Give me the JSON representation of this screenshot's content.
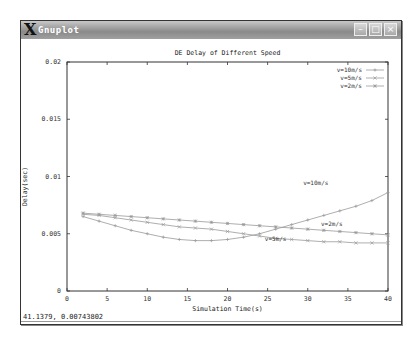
{
  "window": {
    "title": "Gnuplot",
    "buttons": {
      "minimize": "–",
      "maximize": "□",
      "close": "×"
    }
  },
  "status": {
    "coords": "41.1379,  0.00743802"
  },
  "colors": {
    "titlebar": "#9a9a9a",
    "series": "#999999",
    "axis": "#333333"
  },
  "chart_data": {
    "type": "line",
    "title": "DE Delay of Different Speed",
    "xlabel": "Simulation Time(s)",
    "ylabel": "Delay(sec)",
    "xlim": [
      0,
      40
    ],
    "ylim": [
      0,
      0.02
    ],
    "xticks": [
      "0",
      "5",
      "10",
      "15",
      "20",
      "25",
      "30",
      "35",
      "40"
    ],
    "yticks": [
      "0",
      "0.005",
      "0.01",
      "0.015",
      "0.02"
    ],
    "legend_position": "top-right",
    "series": [
      {
        "name": "v=10m/s",
        "marker": "plus",
        "x": [
          2,
          4,
          6,
          8,
          10,
          12,
          14,
          16,
          18,
          20,
          22,
          24,
          26,
          28,
          30,
          32,
          34,
          36,
          38,
          40
        ],
        "values": [
          0.0065,
          0.0061,
          0.0057,
          0.0053,
          0.005,
          0.0047,
          0.0045,
          0.0044,
          0.0044,
          0.0045,
          0.0047,
          0.005,
          0.0054,
          0.0058,
          0.0062,
          0.0066,
          0.007,
          0.0074,
          0.0079,
          0.0086
        ],
        "annotation": {
          "text": "v=10m/s",
          "x": 31,
          "y": 0.0093
        }
      },
      {
        "name": "v=5m/s",
        "marker": "cross",
        "x": [
          2,
          4,
          6,
          8,
          10,
          12,
          14,
          16,
          18,
          20,
          22,
          24,
          26,
          28,
          30,
          32,
          34,
          36,
          38,
          40
        ],
        "values": [
          0.0067,
          0.0066,
          0.0064,
          0.0062,
          0.006,
          0.0058,
          0.0056,
          0.0055,
          0.0054,
          0.0052,
          0.005,
          0.0048,
          0.0046,
          0.0045,
          0.0044,
          0.0043,
          0.0043,
          0.0042,
          0.0042,
          0.0042
        ],
        "annotation": {
          "text": "v=5m/s",
          "x": 26,
          "y": 0.0044
        }
      },
      {
        "name": "v=2m/s",
        "marker": "star",
        "x": [
          2,
          4,
          6,
          8,
          10,
          12,
          14,
          16,
          18,
          20,
          22,
          24,
          26,
          28,
          30,
          32,
          34,
          36,
          38,
          40
        ],
        "values": [
          0.0068,
          0.0067,
          0.0066,
          0.0065,
          0.0064,
          0.0063,
          0.0062,
          0.0061,
          0.006,
          0.0059,
          0.0058,
          0.0057,
          0.0056,
          0.0055,
          0.0054,
          0.0053,
          0.0052,
          0.0051,
          0.005,
          0.0049
        ],
        "annotation": {
          "text": "v=2m/s",
          "x": 33,
          "y": 0.0057
        }
      }
    ]
  }
}
